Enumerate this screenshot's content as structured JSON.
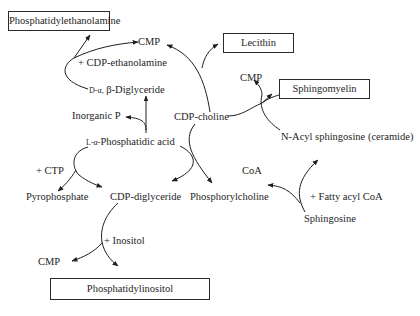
{
  "diagram": {
    "products": {
      "phosphatidylethanolamine": "Phosphatidylethanolamine",
      "lecithin": "Lecithin",
      "sphingomyelin": "Sphingomyelin",
      "phosphatidylinositol": "Phosphatidylinositol"
    },
    "nodes": {
      "cmp_top": "CMP",
      "cdp_ethanolamine": "+ CDP-ethanolamine",
      "diglyceride_prefix": "D-α,",
      "diglyceride": "β-Diglyceride",
      "inorganic_p": "Inorganic P",
      "phosphatidic_prefix": "L-α-",
      "phosphatidic_acid": "Phosphatidic acid",
      "cdp_choline": "CDP-choline",
      "cmp_right": "CMP",
      "ceramide": "N-Acyl sphingosine (ceramide)",
      "ctp": "+ CTP",
      "pyrophosphate": "Pyrophosphate",
      "cdp_diglyceride": "CDP-diglyceride",
      "phosphorylcholine": "Phosphorylcholine",
      "coa": "CoA",
      "fatty_acyl_coa": "+ Fatty acyl CoA",
      "sphingosine": "Sphingosine",
      "inositol": "+ Inositol",
      "cmp_bottom": "CMP"
    },
    "edges": [
      {
        "from": "β-Diglyceride + CDP-ethanolamine",
        "to": "Phosphatidylethanolamine",
        "byproduct": "CMP"
      },
      {
        "from": "CDP-choline + β-Diglyceride",
        "to": "Lecithin",
        "byproduct": "CMP"
      },
      {
        "from": "L-α-Phosphatidic acid",
        "to": "β-Diglyceride",
        "byproduct": "Inorganic P"
      },
      {
        "from": "L-α-Phosphatidic acid + CTP",
        "to": "CDP-diglyceride",
        "byproduct": "Pyrophosphate"
      },
      {
        "from": "CDP-choline",
        "to": "Phosphorylcholine"
      },
      {
        "from": "CDP-choline + N-Acyl sphingosine",
        "to": "Sphingomyelin",
        "byproduct": "CMP"
      },
      {
        "from": "Sphingosine + Fatty acyl CoA",
        "to": "N-Acyl sphingosine (ceramide)",
        "byproduct": "CoA"
      },
      {
        "from": "CDP-diglyceride + Inositol",
        "to": "Phosphatidylinositol",
        "byproduct": "CMP"
      }
    ]
  }
}
